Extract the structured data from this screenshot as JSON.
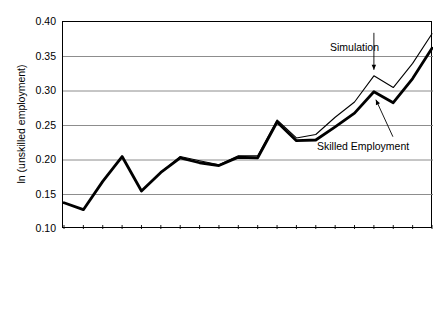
{
  "chart_data": {
    "type": "line",
    "title": "",
    "xlabel": "",
    "ylabel": "ln (unskilled employment)",
    "ylim": [
      0.1,
      0.4
    ],
    "ytick_values": [
      0.4,
      0.35,
      0.3,
      0.25,
      0.2,
      0.15,
      0.1
    ],
    "ytick_labels": [
      "0.40",
      "0.35",
      "0.30",
      "0.25",
      "0.20",
      "0.15",
      "0.10"
    ],
    "grid": "horizontal",
    "legend_position": "inline-annotations",
    "categories": [
      "1992:1",
      "1992:2",
      "1992:3",
      "1992:4",
      "1993:1",
      "1993:2",
      "1993:3",
      "1993:4",
      "1994:1",
      "1994:2",
      "1994:3",
      "1994:4",
      "1995:1",
      "1995:2",
      "1995:3",
      "1995:4",
      "1996:1",
      "1996:2",
      "1996:3",
      "1996:4"
    ],
    "series": [
      {
        "name": "Simulation",
        "style": "thin",
        "values": [
          0.138,
          0.128,
          0.169,
          0.205,
          0.155,
          0.182,
          0.205,
          0.199,
          0.193,
          0.206,
          0.206,
          0.258,
          0.232,
          0.237,
          0.262,
          0.284,
          0.322,
          0.305,
          0.34,
          0.383
        ]
      },
      {
        "name": "Skilled Employment",
        "style": "thick",
        "values": [
          0.138,
          0.128,
          0.169,
          0.205,
          0.155,
          0.182,
          0.203,
          0.196,
          0.192,
          0.204,
          0.203,
          0.255,
          0.228,
          0.229,
          0.248,
          0.268,
          0.299,
          0.283,
          0.318,
          0.362
        ]
      }
    ],
    "annotations": [
      {
        "text": "Simulation",
        "target_series": "Simulation",
        "target_category": "1996:1"
      },
      {
        "text": "Skilled Employment",
        "target_series": "Skilled Employment",
        "target_category": "1996:1"
      }
    ],
    "colors": {
      "line": "#000000",
      "grid": "#808080",
      "axis": "#000000",
      "background": "#ffffff"
    }
  }
}
